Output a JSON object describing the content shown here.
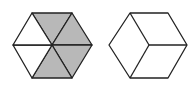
{
  "figure": {
    "width": 195,
    "height": 85,
    "stroke_color": "#222222",
    "shade_color": "#b8b8b8",
    "background": "#ffffff"
  },
  "shapes": [
    {
      "name": "hexagon-divided-six-triangles",
      "center": [
        52,
        45
      ],
      "vertices": [
        [
          32,
          13
        ],
        [
          72,
          13
        ],
        [
          92,
          45
        ],
        [
          72,
          78
        ],
        [
          32,
          78
        ],
        [
          13,
          45
        ]
      ],
      "triangles": [
        {
          "position": "top",
          "shaded": true
        },
        {
          "position": "upper-right",
          "shaded": true
        },
        {
          "position": "lower-right",
          "shaded": true
        },
        {
          "position": "bottom",
          "shaded": true
        },
        {
          "position": "lower-left",
          "shaded": false
        },
        {
          "position": "upper-left",
          "shaded": false
        }
      ]
    },
    {
      "name": "hexagon-cube-outline",
      "center": [
        149,
        45
      ],
      "vertices": [
        [
          130,
          13
        ],
        [
          168,
          13
        ],
        [
          187,
          45
        ],
        [
          168,
          78
        ],
        [
          130,
          78
        ],
        [
          109,
          45
        ]
      ],
      "internal_lines_to": [
        "top-left",
        "right",
        "bottom-left"
      ]
    }
  ]
}
